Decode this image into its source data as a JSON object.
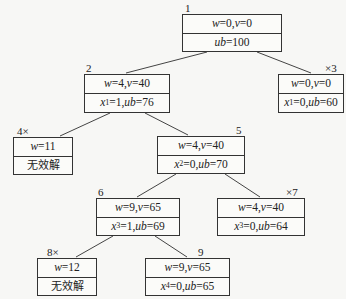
{
  "nodes": [
    {
      "id": "1",
      "label": "1",
      "pruned": false,
      "row1": "w=0, v=0",
      "row2": "ub=100"
    },
    {
      "id": "2",
      "label": "2",
      "pruned": false,
      "row1": "w=4, v=40",
      "row2": "x1=1, ub=76"
    },
    {
      "id": "3",
      "label": "×3",
      "pruned": true,
      "row1": "w=0, v=0",
      "row2": "x1=0, ub=60"
    },
    {
      "id": "4",
      "label": "4×",
      "pruned": true,
      "row1": "w=11",
      "row2": "无效解"
    },
    {
      "id": "5",
      "label": "5",
      "pruned": false,
      "row1": "w=4, v=40",
      "row2": "x2=0, ub=70"
    },
    {
      "id": "6",
      "label": "6",
      "pruned": false,
      "row1": "w=9, v=65",
      "row2": "x3=1, ub=69"
    },
    {
      "id": "7",
      "label": "×7",
      "pruned": true,
      "row1": "w=4, v=40",
      "row2": "x3=0, ub=64"
    },
    {
      "id": "8",
      "label": "8×",
      "pruned": true,
      "row1": "w=12",
      "row2": "无效解"
    },
    {
      "id": "9",
      "label": "9",
      "pruned": false,
      "row1": "w=9, v=65",
      "row2": "x4=0, ub=65"
    }
  ],
  "edges": [
    [
      "1",
      "2"
    ],
    [
      "1",
      "3"
    ],
    [
      "2",
      "4"
    ],
    [
      "2",
      "5"
    ],
    [
      "5",
      "6"
    ],
    [
      "5",
      "7"
    ],
    [
      "6",
      "8"
    ],
    [
      "6",
      "9"
    ]
  ],
  "text": {
    "n1": {
      "label": "1",
      "w": "w",
      "eq0": "=0, ",
      "v": "v",
      "eq1": "=0",
      "ub": "ub",
      "ubv": "=100"
    },
    "n2": {
      "label": "2",
      "w": "w",
      "eq0": "=4, ",
      "v": "v",
      "eq1": "=40",
      "x": "x",
      "sub": "1",
      "xv": "=1, ",
      "ub": "ub",
      "ubv": "=76"
    },
    "n3": {
      "label": "×3",
      "w": "w",
      "eq0": "=0, ",
      "v": "v",
      "eq1": "=0",
      "x": "x",
      "sub": "1",
      "xv": "=0, ",
      "ub": "ub",
      "ubv": "=60"
    },
    "n4": {
      "label": "4×",
      "w": "w",
      "eq0": "=11",
      "invalid": "无效解"
    },
    "n5": {
      "label": "5",
      "w": "w",
      "eq0": "=4, ",
      "v": "v",
      "eq1": "=40",
      "x": "x",
      "sub": "2",
      "xv": "=0, ",
      "ub": "ub",
      "ubv": "=70"
    },
    "n6": {
      "label": "6",
      "w": "w",
      "eq0": "=9, ",
      "v": "v",
      "eq1": "=65",
      "x": "x",
      "sub": "3",
      "xv": "=1, ",
      "ub": "ub",
      "ubv": "=69"
    },
    "n7": {
      "label": "×7",
      "w": "w",
      "eq0": "=4, ",
      "v": "v",
      "eq1": "=40",
      "x": "x",
      "sub": "3",
      "xv": "=0, ",
      "ub": "ub",
      "ubv": "=64"
    },
    "n8": {
      "label": "8×",
      "w": "w",
      "eq0": "=12",
      "invalid": "无效解"
    },
    "n9": {
      "label": "9",
      "w": "w",
      "eq0": "=9, ",
      "v": "v",
      "eq1": "=65",
      "x": "x",
      "sub": "4",
      "xv": "=0, ",
      "ub": "ub",
      "ubv": "=65"
    }
  },
  "colors": {
    "line": "#333333",
    "background": "#f7f7f5"
  }
}
